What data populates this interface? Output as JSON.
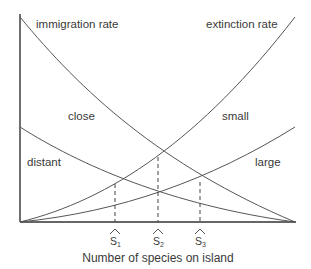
{
  "diagram": {
    "x_axis_label": "Number of species on island",
    "curve_labels": {
      "immigration": "immigration rate",
      "extinction": "extinction rate",
      "close": "close",
      "distant": "distant",
      "small": "small",
      "large": "large"
    },
    "equilibria": [
      {
        "id": "S1",
        "label": "S",
        "subscript": "1",
        "x": 115,
        "y": 184,
        "meaning": "distant & large"
      },
      {
        "id": "S2",
        "label": "S",
        "subscript": "2",
        "x": 158,
        "y": 157,
        "meaning": "close & small / distant & small-large"
      },
      {
        "id": "S3",
        "label": "S",
        "subscript": "3",
        "x": 200,
        "y": 182,
        "meaning": "close & large"
      }
    ],
    "curves": [
      {
        "name": "immigration-close",
        "type": "decreasing",
        "from": [
          20,
          17
        ],
        "to": [
          295,
          222
        ]
      },
      {
        "name": "immigration-distant",
        "type": "decreasing",
        "from": [
          20,
          127
        ],
        "to": [
          295,
          222
        ]
      },
      {
        "name": "extinction-small",
        "type": "increasing",
        "from": [
          20,
          222
        ],
        "to": [
          295,
          17
        ]
      },
      {
        "name": "extinction-large",
        "type": "increasing",
        "from": [
          20,
          222
        ],
        "to": [
          295,
          127
        ]
      }
    ],
    "colors": {
      "axis": "#333333",
      "curve": "#555555",
      "text": "#3a3a3a",
      "background": "#ffffff"
    }
  }
}
